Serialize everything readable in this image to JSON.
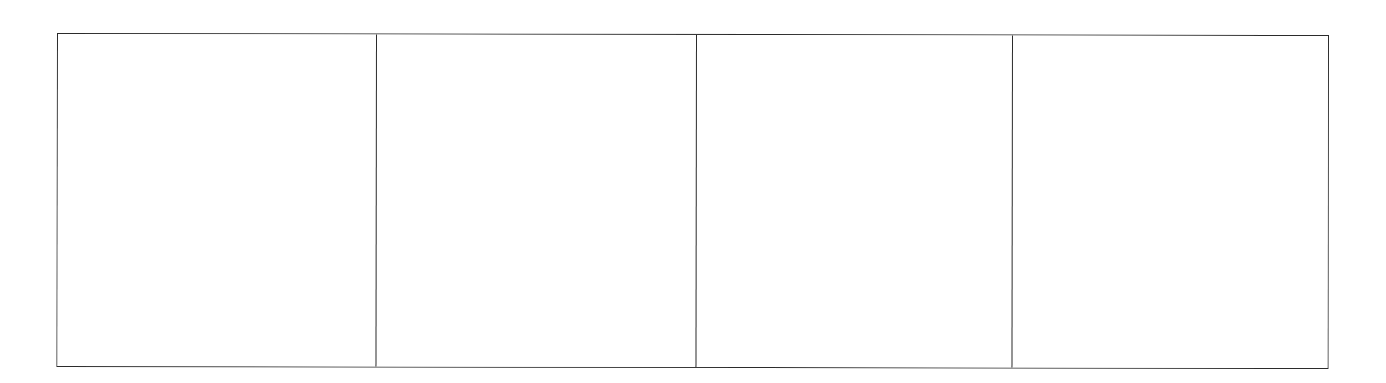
{
  "diagram": {
    "type": "panel-grid",
    "rows": 1,
    "columns": 4,
    "border_color": "#2b2b2b",
    "background_color": "#ffffff",
    "panels": [
      {
        "index": 1,
        "width": 318,
        "content": ""
      },
      {
        "index": 2,
        "width": 320,
        "content": ""
      },
      {
        "index": 3,
        "width": 316,
        "content": ""
      },
      {
        "index": 4,
        "width": 316,
        "content": ""
      }
    ]
  }
}
